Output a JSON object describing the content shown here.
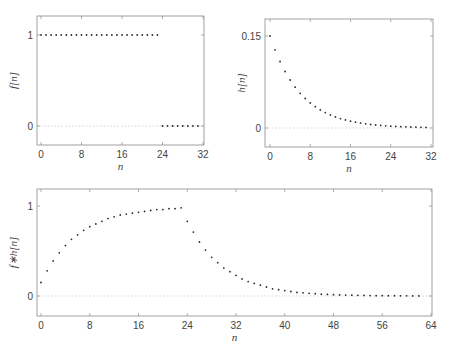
{
  "chart_data": [
    {
      "id": "f",
      "type": "scatter",
      "title": "",
      "xlabel": "n",
      "ylabel": "f[n]",
      "xlim": [
        -1,
        32
      ],
      "ylim": [
        -0.2,
        1.2
      ],
      "xticks": [
        0,
        8,
        16,
        24,
        32
      ],
      "yticks": [
        0,
        1
      ],
      "ytick_labels": [
        "0",
        "1"
      ],
      "zero_line": true,
      "x": [
        0,
        1,
        2,
        3,
        4,
        5,
        6,
        7,
        8,
        9,
        10,
        11,
        12,
        13,
        14,
        15,
        16,
        17,
        18,
        19,
        20,
        21,
        22,
        23,
        24,
        25,
        26,
        27,
        28,
        29,
        30,
        31
      ],
      "values": [
        1,
        1,
        1,
        1,
        1,
        1,
        1,
        1,
        1,
        1,
        1,
        1,
        1,
        1,
        1,
        1,
        1,
        1,
        1,
        1,
        1,
        1,
        1,
        1,
        0,
        0,
        0,
        0,
        0,
        0,
        0,
        0
      ]
    },
    {
      "id": "h",
      "type": "scatter",
      "title": "",
      "xlabel": "n",
      "ylabel": "h[n]",
      "xlim": [
        -1,
        32
      ],
      "ylim": [
        -0.03,
        0.18
      ],
      "xticks": [
        0,
        8,
        16,
        24,
        32
      ],
      "yticks": [
        0,
        0.15
      ],
      "ytick_labels": [
        "0",
        "0.15"
      ],
      "zero_line": true,
      "x": [
        0,
        1,
        2,
        3,
        4,
        5,
        6,
        7,
        8,
        9,
        10,
        11,
        12,
        13,
        14,
        15,
        16,
        17,
        18,
        19,
        20,
        21,
        22,
        23,
        24,
        25,
        26,
        27,
        28,
        29,
        30,
        31
      ],
      "values": [
        0.15,
        0.1275,
        0.1084,
        0.0921,
        0.0783,
        0.0666,
        0.0566,
        0.0481,
        0.0409,
        0.0347,
        0.0295,
        0.0251,
        0.0213,
        0.0181,
        0.0154,
        0.0131,
        0.0111,
        0.0095,
        0.008,
        0.0068,
        0.0058,
        0.0049,
        0.0042,
        0.0036,
        0.003,
        0.0026,
        0.0022,
        0.0019,
        0.0016,
        0.0013,
        0.0011,
        0.001
      ]
    },
    {
      "id": "fh",
      "type": "scatter",
      "title": "",
      "xlabel": "n",
      "ylabel": "f∗h[n]",
      "xlim": [
        -1,
        64
      ],
      "ylim": [
        -0.2,
        1.2
      ],
      "xticks": [
        0,
        8,
        16,
        24,
        32,
        40,
        48,
        56,
        64
      ],
      "yticks": [
        0,
        1
      ],
      "ytick_labels": [
        "0",
        "1"
      ],
      "zero_line": true,
      "x": [
        0,
        1,
        2,
        3,
        4,
        5,
        6,
        7,
        8,
        9,
        10,
        11,
        12,
        13,
        14,
        15,
        16,
        17,
        18,
        19,
        20,
        21,
        22,
        23,
        24,
        25,
        26,
        27,
        28,
        29,
        30,
        31,
        32,
        33,
        34,
        35,
        36,
        37,
        38,
        39,
        40,
        41,
        42,
        43,
        44,
        45,
        46,
        47,
        48,
        49,
        50,
        51,
        52,
        53,
        54,
        55,
        56,
        57,
        58,
        59,
        60,
        61,
        62
      ],
      "values": [
        0.15,
        0.28,
        0.39,
        0.48,
        0.56,
        0.63,
        0.68,
        0.73,
        0.77,
        0.8,
        0.83,
        0.86,
        0.88,
        0.9,
        0.91,
        0.92,
        0.93,
        0.94,
        0.95,
        0.96,
        0.96,
        0.97,
        0.97,
        0.98,
        0.83,
        0.71,
        0.6,
        0.51,
        0.43,
        0.37,
        0.31,
        0.27,
        0.23,
        0.19,
        0.16,
        0.14,
        0.12,
        0.1,
        0.08,
        0.07,
        0.06,
        0.05,
        0.04,
        0.035,
        0.03,
        0.025,
        0.02,
        0.018,
        0.015,
        0.012,
        0.01,
        0.009,
        0.008,
        0.006,
        0.005,
        0.004,
        0.004,
        0.003,
        0.003,
        0.002,
        0.002,
        0.001,
        0.001
      ]
    }
  ],
  "panels": {
    "f": {
      "box": [
        37,
        16,
        204,
        145
      ],
      "x0": 41,
      "x1": 203,
      "xmin": 0,
      "xmax": 32,
      "y0px": 126,
      "y1px": 35,
      "y0": 0,
      "y1": 1
    },
    "h": {
      "box": [
        265,
        19,
        433,
        147
      ],
      "x0": 270,
      "x1": 431,
      "xmin": 0,
      "xmax": 32,
      "y0px": 128,
      "y1px": 36,
      "y0": 0,
      "y1": 0.15
    },
    "fh": {
      "box": [
        37,
        189,
        432,
        316
      ],
      "x0": 41,
      "x1": 431,
      "xmin": 0,
      "xmax": 64,
      "y0px": 296,
      "y1px": 206,
      "y0": 0,
      "y1": 1
    }
  },
  "colors": {
    "frame": "#8a8a8a",
    "dot": "#2a2a2a",
    "zero_line": "#c8c8c8",
    "text": "#444444"
  }
}
